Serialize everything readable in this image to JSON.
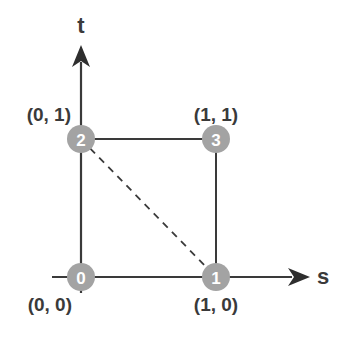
{
  "diagram": {
    "colors": {
      "line": "#3a3a3a",
      "node_fill": "#a3a3a3",
      "node_text": "#ffffff",
      "label": "#3a3a3a"
    },
    "axes": {
      "horizontal": {
        "label": "s"
      },
      "vertical": {
        "label": "t"
      }
    },
    "nodes": [
      {
        "id": "0",
        "label": "0",
        "coord_label": "(0, 0)"
      },
      {
        "id": "1",
        "label": "1",
        "coord_label": "(1, 0)"
      },
      {
        "id": "2",
        "label": "2",
        "coord_label": "(0, 1)"
      },
      {
        "id": "3",
        "label": "3",
        "coord_label": "(1, 1)"
      }
    ],
    "edges": [
      {
        "from": "0",
        "to": "1",
        "style": "solid"
      },
      {
        "from": "1",
        "to": "3",
        "style": "solid"
      },
      {
        "from": "3",
        "to": "2",
        "style": "solid"
      },
      {
        "from": "2",
        "to": "0",
        "style": "solid"
      },
      {
        "from": "2",
        "to": "1",
        "style": "dashed"
      }
    ]
  }
}
